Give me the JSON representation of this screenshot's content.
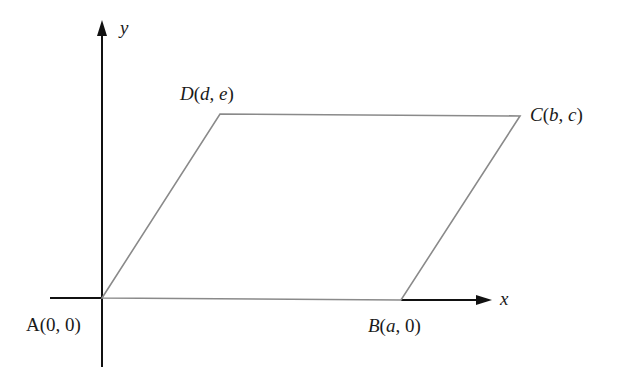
{
  "diagram": {
    "type": "coordinate-geometry",
    "axes": {
      "x_label": "x",
      "y_label": "y",
      "color": "#111111"
    },
    "shape": {
      "name": "parallelogram",
      "stroke_color": "#8a8a8a",
      "vertices": [
        {
          "id": "A",
          "letter": "A",
          "coords": "(0, 0)",
          "coord_parts": [
            "0",
            "0"
          ]
        },
        {
          "id": "B",
          "letter": "B",
          "coords": "(a, 0)",
          "coord_parts": [
            "a",
            "0"
          ]
        },
        {
          "id": "C",
          "letter": "C",
          "coords": "(b, c)",
          "coord_parts": [
            "b",
            "c"
          ]
        },
        {
          "id": "D",
          "letter": "D",
          "coords": "(d, e)",
          "coord_parts": [
            "d",
            "e"
          ]
        }
      ]
    }
  }
}
